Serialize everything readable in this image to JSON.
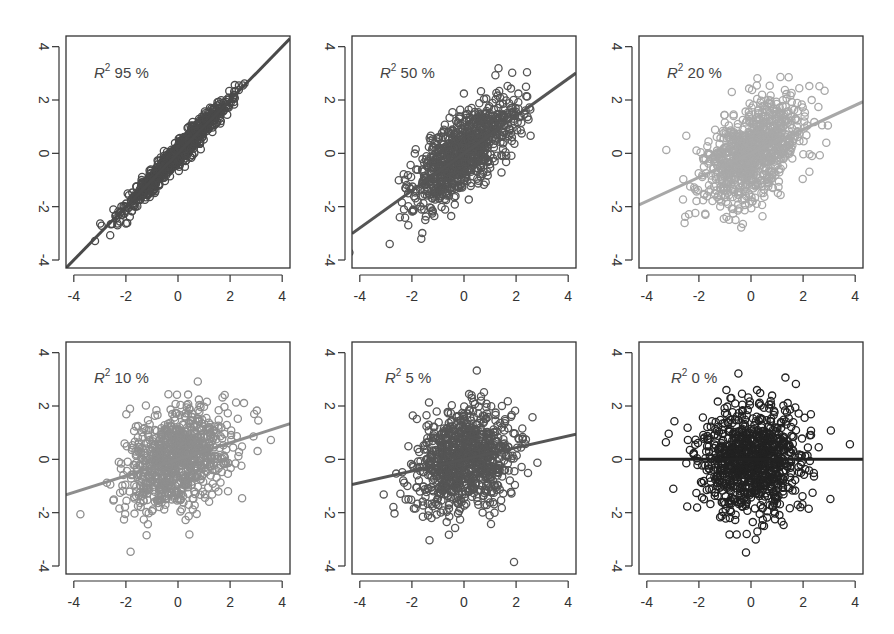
{
  "chart_data": [
    {
      "type": "scatter",
      "label": "R² 95 %",
      "r2_percent": 95,
      "slope": 1.0,
      "intercept": 0.0,
      "point_color": "#4a4a4a",
      "line_color": "#4a4a4a",
      "n_points": 900,
      "xlim": [
        -4.3,
        4.3
      ],
      "ylim": [
        -4.3,
        4.4
      ],
      "xticks": [
        -4,
        -2,
        0,
        2,
        4
      ],
      "yticks": [
        -4,
        -2,
        0,
        2,
        4
      ],
      "xlabel": "",
      "ylabel": "",
      "grid": false
    },
    {
      "type": "scatter",
      "label": "R² 50 %",
      "r2_percent": 50,
      "slope": 0.7,
      "intercept": 0.0,
      "point_color": "#555555",
      "line_color": "#555555",
      "n_points": 900,
      "xlim": [
        -4.3,
        4.3
      ],
      "ylim": [
        -4.3,
        4.4
      ],
      "xticks": [
        -4,
        -2,
        0,
        2,
        4
      ],
      "yticks": [
        -4,
        -2,
        0,
        2,
        4
      ],
      "xlabel": "",
      "ylabel": "",
      "grid": false
    },
    {
      "type": "scatter",
      "label": "R² 20 %",
      "r2_percent": 20,
      "slope": 0.45,
      "intercept": 0.0,
      "point_color": "#a8a8a8",
      "line_color": "#a8a8a8",
      "n_points": 900,
      "xlim": [
        -4.3,
        4.3
      ],
      "ylim": [
        -4.3,
        4.4
      ],
      "xticks": [
        -4,
        -2,
        0,
        2,
        4
      ],
      "yticks": [
        -4,
        -2,
        0,
        2,
        4
      ],
      "xlabel": "",
      "ylabel": "",
      "grid": false
    },
    {
      "type": "scatter",
      "label": "R² 10 %",
      "r2_percent": 10,
      "slope": 0.31,
      "intercept": 0.0,
      "point_color": "#8e8e8e",
      "line_color": "#8e8e8e",
      "n_points": 900,
      "xlim": [
        -4.3,
        4.3
      ],
      "ylim": [
        -4.3,
        4.4
      ],
      "xticks": [
        -4,
        -2,
        0,
        2,
        4
      ],
      "yticks": [
        -4,
        -2,
        0,
        2,
        4
      ],
      "xlabel": "",
      "ylabel": "",
      "grid": false
    },
    {
      "type": "scatter",
      "label": "R² 5 %",
      "r2_percent": 5,
      "slope": 0.22,
      "intercept": 0.0,
      "point_color": "#555555",
      "line_color": "#555555",
      "n_points": 900,
      "xlim": [
        -4.3,
        4.3
      ],
      "ylim": [
        -4.3,
        4.4
      ],
      "xticks": [
        -4,
        -2,
        0,
        2,
        4
      ],
      "yticks": [
        -4,
        -2,
        0,
        2,
        4
      ],
      "xlabel": "",
      "ylabel": "",
      "grid": false
    },
    {
      "type": "scatter",
      "label": "R² 0 %",
      "r2_percent": 0,
      "slope": 0.0,
      "intercept": 0.0,
      "point_color": "#222222",
      "line_color": "#222222",
      "n_points": 900,
      "xlim": [
        -4.3,
        4.3
      ],
      "ylim": [
        -4.3,
        4.4
      ],
      "xticks": [
        -4,
        -2,
        0,
        2,
        4
      ],
      "yticks": [
        -4,
        -2,
        0,
        2,
        4
      ],
      "xlabel": "",
      "ylabel": "",
      "grid": false
    }
  ],
  "panels": [
    {
      "label_prefix": "R",
      "label_sup": "2",
      "label_value": " 95 %"
    },
    {
      "label_prefix": "R",
      "label_sup": "2",
      "label_value": " 50 %"
    },
    {
      "label_prefix": "R",
      "label_sup": "2",
      "label_value": " 20 %"
    },
    {
      "label_prefix": "R",
      "label_sup": "2",
      "label_value": " 10 %"
    },
    {
      "label_prefix": "R",
      "label_sup": "2",
      "label_value": " 5 %"
    },
    {
      "label_prefix": "R",
      "label_sup": "2",
      "label_value": " 0 %"
    }
  ],
  "layout": {
    "columns_x": [
      66,
      352,
      639
    ],
    "rows_y": [
      36,
      342
    ],
    "box_width": 224,
    "box_height": 232,
    "axis_color": "#333333",
    "tick_label_color": "#333333"
  }
}
